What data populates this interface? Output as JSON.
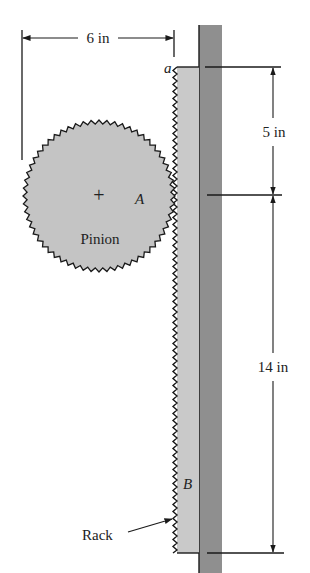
{
  "figure": {
    "labels": {
      "width_dim": "6 in",
      "upper_dim": "5 in",
      "lower_dim": "14 in",
      "point_a_lower": "a",
      "point_A": "A",
      "point_B": "B",
      "pinion": "Pinion",
      "rack": "Rack",
      "center_mark": "+"
    },
    "colors": {
      "wall": "#8f8f8f",
      "rack": "#c9c9c9",
      "pinion": "#c4c4c4",
      "line": "#1a1a1a"
    }
  }
}
